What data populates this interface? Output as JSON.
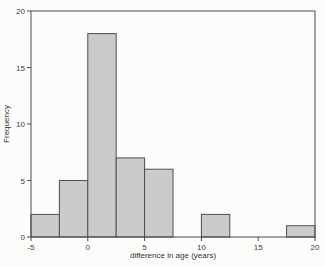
{
  "chart_data": {
    "type": "bar",
    "subtype": "histogram",
    "title": "",
    "xlabel": "difference in age (years)",
    "ylabel": "Frequency",
    "xlim": [
      -5,
      20
    ],
    "ylim": [
      0,
      20
    ],
    "x_ticks": [
      -5,
      0,
      5,
      10,
      15,
      20
    ],
    "y_ticks": [
      0,
      5,
      10,
      15,
      20
    ],
    "grid": false,
    "bin_width": 2.5,
    "bins": [
      {
        "range": [
          -5,
          -2.5
        ],
        "count": 2
      },
      {
        "range": [
          -2.5,
          0
        ],
        "count": 5
      },
      {
        "range": [
          0,
          2.5
        ],
        "count": 18
      },
      {
        "range": [
          2.5,
          5
        ],
        "count": 7
      },
      {
        "range": [
          5,
          7.5
        ],
        "count": 6
      },
      {
        "range": [
          7.5,
          10
        ],
        "count": 0
      },
      {
        "range": [
          10,
          12.5
        ],
        "count": 2
      },
      {
        "range": [
          12.5,
          15
        ],
        "count": 0
      },
      {
        "range": [
          15,
          17.5
        ],
        "count": 0
      },
      {
        "range": [
          17.5,
          20
        ],
        "count": 1
      }
    ],
    "total_count": 41,
    "colors": {
      "bar_fill": "#cacccb",
      "bar_stroke": "#4f4f4f",
      "axis": "#4a4a4a",
      "tick_label": "#3c3c3c",
      "background": "#fcfcfa"
    }
  }
}
